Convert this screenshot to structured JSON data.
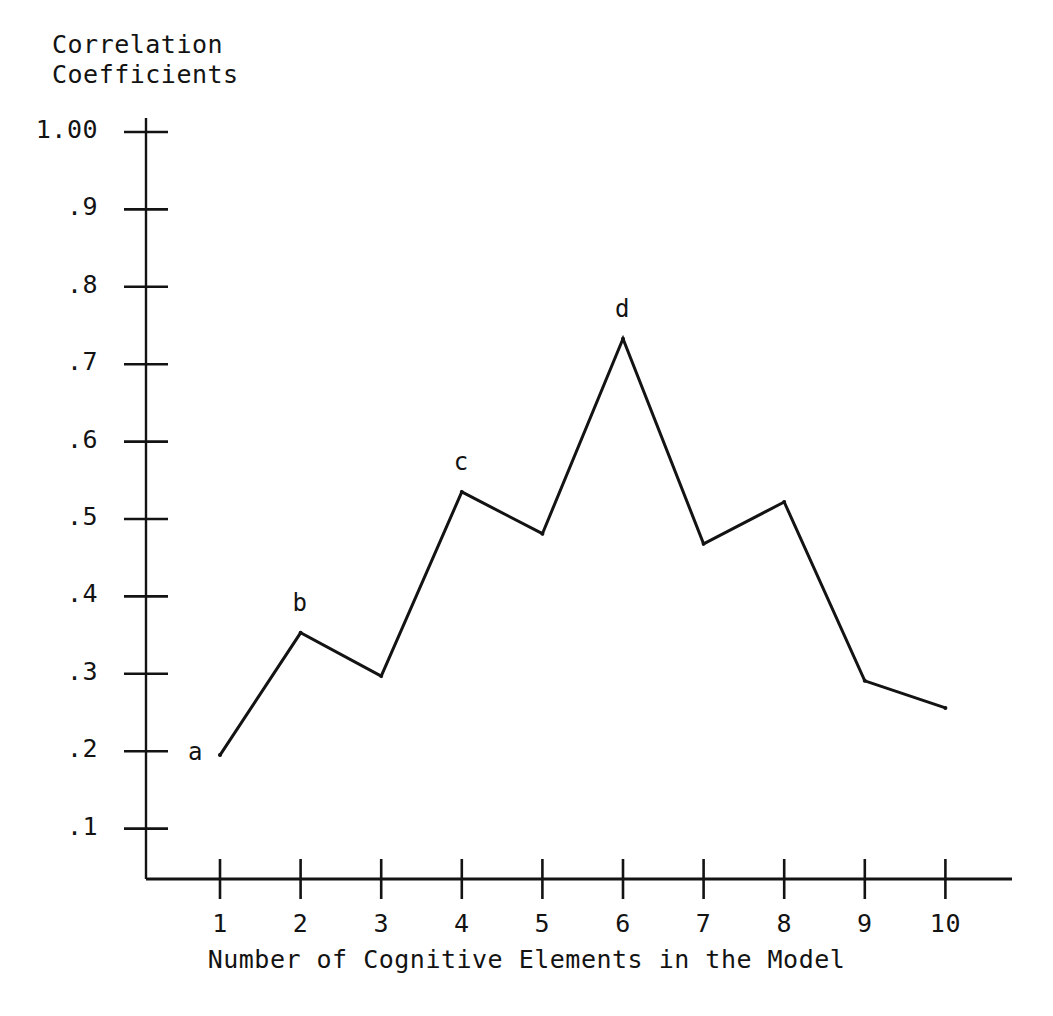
{
  "chart_data": {
    "type": "line",
    "title": "",
    "ylabel": "Correlation\nCoefficients",
    "ylabel_line1": "Correlation",
    "ylabel_line2": "Coefficients",
    "xlabel": "Number of Cognitive Elements in the Model",
    "x": [
      1,
      2,
      3,
      4,
      5,
      6,
      7,
      8,
      9,
      10
    ],
    "values": [
      0.195,
      0.353,
      0.297,
      0.535,
      0.481,
      0.733,
      0.468,
      0.522,
      0.291,
      0.256
    ],
    "point_labels": [
      {
        "x": 1,
        "label": "a"
      },
      {
        "x": 2,
        "label": "b"
      },
      {
        "x": 4,
        "label": "c"
      },
      {
        "x": 6,
        "label": "d"
      }
    ],
    "ytick_labels": [
      "1.00",
      ".9",
      ".8",
      ".7",
      ".6",
      ".5",
      ".4",
      ".3",
      ".2",
      ".1"
    ],
    "ytick_values": [
      1.0,
      0.9,
      0.8,
      0.7,
      0.6,
      0.5,
      0.4,
      0.3,
      0.2,
      0.1
    ],
    "xtick_labels": [
      "1",
      "2",
      "3",
      "4",
      "5",
      "6",
      "7",
      "8",
      "9",
      "10"
    ],
    "xlim": [
      0.55,
      10.5
    ],
    "ylim": [
      0.02,
      1.04
    ],
    "grid": false,
    "legend": false,
    "line_color": "#131313",
    "axis_color": "#131313"
  }
}
